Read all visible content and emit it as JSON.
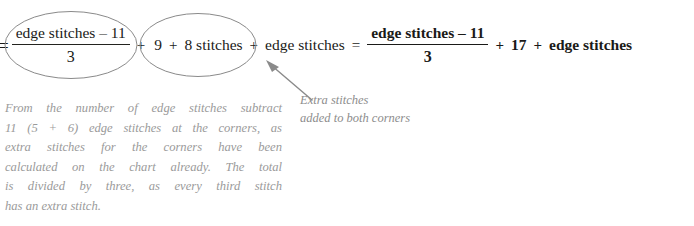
{
  "figure": {
    "kind": "math-equation-annotated",
    "background_color": "#ffffff",
    "equation_text_color": "#1a1a18",
    "annotation_text_color": "#8d8d8d",
    "caption_text_color": "#9a9a9a",
    "ellipse_stroke_color": "#8a8a8a",
    "arrow_stroke_color": "#8a8a8a"
  },
  "equation": {
    "lead_equals": "=",
    "left_fraction": {
      "numerator": "edge stitches – 11",
      "denominator": "3"
    },
    "plus_1": "+",
    "extra_group": {
      "first": "9",
      "plus": "+",
      "second": "8 stitches"
    },
    "plus_2": "+",
    "edge_stitches_term": "edge stitches",
    "mid_equals": "=",
    "right_fraction": {
      "numerator": "edge stitches – 11",
      "denominator": "3"
    },
    "plus_3": "+",
    "constant_17": "17",
    "plus_4": "+",
    "right_edge_stitches": "edge stitches"
  },
  "extra_note": {
    "lines": [
      "Extra stitches",
      "added to both corners"
    ]
  },
  "caption": {
    "lines": [
      "From the number of edge stitches subtract",
      "11 (5 + 6) edge stitches at the corners, as",
      "extra stitches for the corners  have been",
      "calculated on the chart already. The total",
      "is divided by three, as every third stitch",
      "has an extra stitch."
    ]
  },
  "icons": {
    "ellipse_fraction": "ellipse-annotation-icon",
    "ellipse_extra": "ellipse-annotation-icon",
    "arrow": "arrow-pointer-icon"
  }
}
